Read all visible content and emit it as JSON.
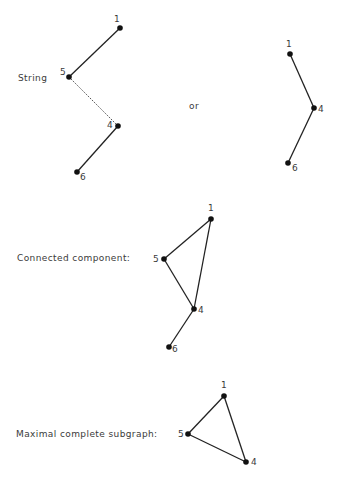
{
  "diagram": {
    "sections": [
      {
        "id": "string",
        "label": "String",
        "label_pos": [
          18,
          74
        ],
        "graphs": [
          {
            "id": "string-a",
            "nodes": [
              {
                "id": "1",
                "x": 120,
                "y": 28,
                "label": "1",
                "label_dx": -6,
                "label_dy": -6
              },
              {
                "id": "5",
                "x": 69,
                "y": 77,
                "label": "5",
                "label_dx": -9,
                "label_dy": -2
              },
              {
                "id": "4",
                "x": 118,
                "y": 126,
                "label": "4",
                "label_dx": -11,
                "label_dy": 2
              },
              {
                "id": "6",
                "x": 77,
                "y": 172,
                "label": "6",
                "label_dx": 3,
                "label_dy": 8
              }
            ],
            "edges": [
              [
                "1",
                "5"
              ],
              [
                "5",
                "4"
              ],
              [
                "4",
                "6"
              ]
            ],
            "faint_edges": [
              [
                "5",
                "4"
              ]
            ]
          },
          {
            "id": "string-b",
            "nodes": [
              {
                "id": "1",
                "x": 290,
                "y": 54,
                "label": "1",
                "label_dx": -4,
                "label_dy": -7
              },
              {
                "id": "4",
                "x": 314,
                "y": 108,
                "label": "4",
                "label_dx": 4,
                "label_dy": 4
              },
              {
                "id": "6",
                "x": 288,
                "y": 163,
                "label": "6",
                "label_dx": 4,
                "label_dy": 8
              }
            ],
            "edges": [
              [
                "1",
                "4"
              ],
              [
                "4",
                "6"
              ]
            ]
          }
        ],
        "connector_text": "or",
        "connector_pos": [
          189,
          103
        ]
      },
      {
        "id": "connected-component",
        "label": "Connected  component:",
        "label_pos": [
          17,
          254
        ],
        "graphs": [
          {
            "id": "cc",
            "nodes": [
              {
                "id": "1",
                "x": 211,
                "y": 219,
                "label": "1",
                "label_dx": -3,
                "label_dy": -8
              },
              {
                "id": "5",
                "x": 164,
                "y": 259,
                "label": "5",
                "label_dx": -11,
                "label_dy": 3
              },
              {
                "id": "4",
                "x": 194,
                "y": 309,
                "label": "4",
                "label_dx": 4,
                "label_dy": 4
              },
              {
                "id": "6",
                "x": 169,
                "y": 347,
                "label": "6",
                "label_dx": 3,
                "label_dy": 5
              }
            ],
            "edges": [
              [
                "1",
                "5"
              ],
              [
                "1",
                "4"
              ],
              [
                "5",
                "4"
              ],
              [
                "4",
                "6"
              ]
            ]
          }
        ]
      },
      {
        "id": "maximal-complete-subgraph",
        "label": "Maximal  complete  subgraph:",
        "label_pos": [
          16,
          430
        ],
        "graphs": [
          {
            "id": "mcs",
            "nodes": [
              {
                "id": "1",
                "x": 224,
                "y": 396,
                "label": "1",
                "label_dx": -3,
                "label_dy": -8
              },
              {
                "id": "5",
                "x": 188,
                "y": 434,
                "label": "5",
                "label_dx": -10,
                "label_dy": 3
              },
              {
                "id": "4",
                "x": 246,
                "y": 462,
                "label": "4",
                "label_dx": 5,
                "label_dy": 3
              }
            ],
            "edges": [
              [
                "1",
                "5"
              ],
              [
                "1",
                "4"
              ],
              [
                "5",
                "4"
              ]
            ]
          }
        ]
      }
    ]
  }
}
